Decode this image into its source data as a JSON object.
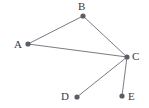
{
  "figure": {
    "name": "undirected-graph-diagram",
    "background_color": "#ffffff",
    "width": 149,
    "height": 108
  },
  "style": {
    "edge_color": "#7b7b86",
    "edge_width": 1,
    "node_color": "#5d5d68",
    "node_radius": 2.6,
    "label_color": "#3a3a42",
    "label_font_size": 11
  },
  "chart_data": {
    "type": "diagram",
    "subtype": "node-link-graph",
    "directed": false,
    "title": "",
    "nodes": [
      {
        "id": "A",
        "label": "A",
        "x": 28,
        "y": 44,
        "label_x": 14,
        "label_y": 39
      },
      {
        "id": "B",
        "label": "B",
        "x": 83,
        "y": 16,
        "label_x": 78,
        "label_y": 1
      },
      {
        "id": "C",
        "label": "C",
        "x": 127,
        "y": 57,
        "label_x": 132,
        "label_y": 51
      },
      {
        "id": "D",
        "label": "D",
        "x": 77,
        "y": 97,
        "label_x": 61,
        "label_y": 91
      },
      {
        "id": "E",
        "label": "E",
        "x": 122,
        "y": 96,
        "label_x": 128,
        "label_y": 91
      }
    ],
    "edges": [
      {
        "id": "A-B",
        "source": "A",
        "target": "B"
      },
      {
        "id": "B-C",
        "source": "B",
        "target": "C"
      },
      {
        "id": "A-C",
        "source": "A",
        "target": "C"
      },
      {
        "id": "C-D",
        "source": "C",
        "target": "D"
      },
      {
        "id": "C-E",
        "source": "C",
        "target": "E"
      }
    ],
    "node_count": 5,
    "edge_count": 5,
    "degrees": {
      "A": 2,
      "B": 2,
      "C": 4,
      "D": 1,
      "E": 1
    }
  }
}
